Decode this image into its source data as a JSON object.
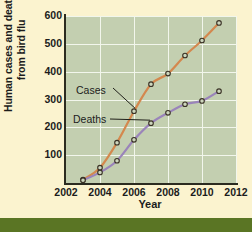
{
  "chart_data": {
    "type": "line",
    "title": "",
    "xlabel": "Year",
    "ylabel": "Human cases and deaths from bird flu",
    "ylabel_line1": "Human cases and deaths",
    "ylabel_line2": "from bird flu",
    "xlim": [
      2002,
      2012
    ],
    "ylim": [
      0,
      600
    ],
    "xticks": [
      2002,
      2004,
      2006,
      2008,
      2010,
      2012
    ],
    "yticks": [
      100,
      200,
      300,
      400,
      500,
      600
    ],
    "grid": true,
    "legend_position": "inline-annotations",
    "x": [
      2003,
      2004,
      2005,
      2006,
      2007,
      2008,
      2009,
      2010,
      2011
    ],
    "series": [
      {
        "name": "Cases",
        "color": "#d4884e",
        "values": [
          12,
          55,
          145,
          258,
          355,
          393,
          458,
          512,
          575
        ]
      },
      {
        "name": "Deaths",
        "color": "#9a84ba",
        "values": [
          10,
          38,
          80,
          155,
          215,
          252,
          283,
          295,
          330
        ]
      }
    ],
    "annotations": [
      {
        "label": "Cases",
        "target_x": 2006,
        "target_y": 258
      },
      {
        "label": "Deaths",
        "target_x": 2007,
        "target_y": 215
      }
    ],
    "colors": {
      "page_background": "#fbf3cf",
      "plot_background": "#c3cfb0",
      "gridline": "#f2f6ec",
      "axis": "#2b2b20",
      "bottom_bar": "#5a7524",
      "marker_edge": "#3a3226",
      "marker_fill": "#cdd6bd"
    }
  }
}
